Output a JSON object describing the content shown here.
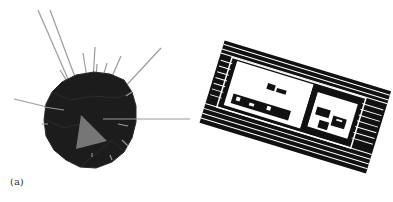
{
  "figure": {
    "panels": [
      {
        "id": "a",
        "label": "(a)",
        "description": "Dark polyhedral sphere with grey ray lines and a grey triangle"
      },
      {
        "id": "b",
        "label": "(b)",
        "description": "Black and white point cloud of a rectangular building rotated, viewed from above"
      }
    ]
  },
  "colors": {
    "background": "#ffffff",
    "sphere": "#1c1c1c",
    "rays": "#9a9a9a",
    "triangle": "#7a7a7a",
    "point_cloud": "#111111"
  }
}
